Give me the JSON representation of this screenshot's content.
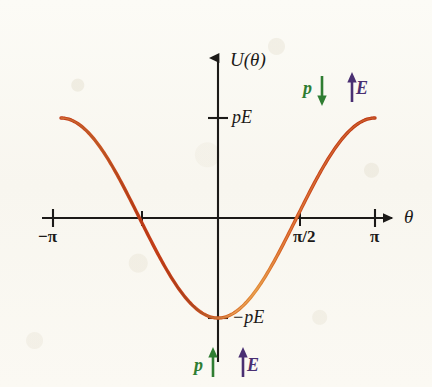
{
  "figure": {
    "kind": "physics-potential-energy-plot",
    "background_color": "#fbfaf4",
    "curve_color_dark": "#c03a16",
    "curve_color_light": "#e8893a",
    "axis_color": "#1c1a18",
    "p_vector_color": "#2f7d32",
    "e_vector_color": "#4a2f72"
  },
  "axes": {
    "y_label": "U(θ)",
    "x_label": "θ",
    "x_ticks": [
      {
        "label": "−π",
        "value": -3.14159
      },
      {
        "label": "",
        "value": -1.5708
      },
      {
        "label": "π/2",
        "value": 1.5708
      },
      {
        "label": "π",
        "value": 3.14159
      }
    ],
    "y_ticks": [
      {
        "label": "pE",
        "value": 1
      },
      {
        "label": "−pE",
        "value": -1
      }
    ]
  },
  "annotations": {
    "top_right": {
      "p_symbol": "p⃗",
      "p_direction": "down",
      "e_symbol": "E⃗",
      "e_direction": "up",
      "meaning": "antiparallel-maximum-energy"
    },
    "bottom_center": {
      "p_symbol": "p⃗",
      "p_direction": "up",
      "e_symbol": "E⃗",
      "e_direction": "up",
      "meaning": "parallel-minimum-energy"
    }
  },
  "chart_data": {
    "type": "line",
    "title": "",
    "xlabel": "θ",
    "ylabel": "U(θ)",
    "xlim": [
      -3.14159,
      3.14159
    ],
    "ylim": [
      -1,
      1
    ],
    "grid": false,
    "legend": "none",
    "equation": "U(θ) = -pE cos(θ)",
    "x": [
      -3.14159,
      -2.87979,
      -2.61799,
      -2.35619,
      -2.0944,
      -1.8326,
      -1.5708,
      -1.309,
      -1.0472,
      -0.7854,
      -0.5236,
      -0.2618,
      0,
      0.2618,
      0.5236,
      0.7854,
      1.0472,
      1.309,
      1.5708,
      1.8326,
      2.0944,
      2.35619,
      2.61799,
      2.87979,
      3.14159
    ],
    "y": [
      1,
      0.96593,
      0.86603,
      0.70711,
      0.5,
      0.25882,
      0,
      -0.25882,
      -0.5,
      -0.70711,
      -0.86603,
      -0.96593,
      -1,
      -0.96593,
      -0.86603,
      -0.70711,
      -0.5,
      -0.25882,
      0,
      0.25882,
      0.5,
      0.70711,
      0.86603,
      0.96593,
      1
    ],
    "y_units": "pE",
    "zero_crossings": [
      -1.5708,
      1.5708
    ],
    "minimum": {
      "x": 0,
      "y": -1
    },
    "maxima": [
      {
        "x": -3.14159,
        "y": 1
      },
      {
        "x": 3.14159,
        "y": 1
      }
    ]
  }
}
